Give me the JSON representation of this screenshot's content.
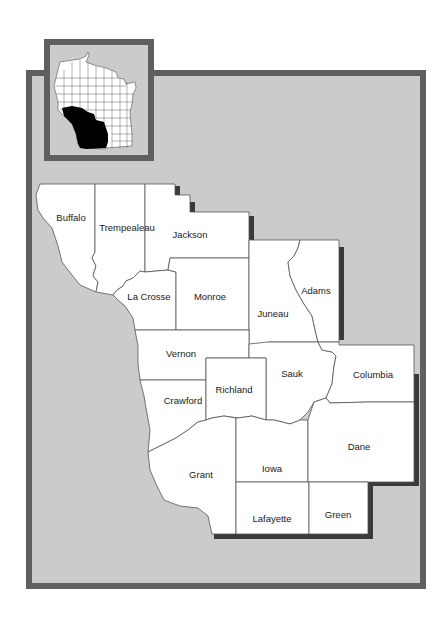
{
  "map": {
    "region": "Southwestern Wisconsin",
    "colors": {
      "frame_border": "#5f5f5f",
      "frame_fill": "#cbcbcb",
      "county_fill": "#ffffff",
      "county_stroke": "#555555",
      "shadow": "#3a3a3a",
      "inset_highlight": "#000000"
    },
    "counties": [
      {
        "name": "Buffalo"
      },
      {
        "name": "Trempealeau"
      },
      {
        "name": "Jackson"
      },
      {
        "name": "La Crosse"
      },
      {
        "name": "Monroe"
      },
      {
        "name": "Juneau"
      },
      {
        "name": "Adams"
      },
      {
        "name": "Vernon"
      },
      {
        "name": "Sauk"
      },
      {
        "name": "Columbia"
      },
      {
        "name": "Crawford"
      },
      {
        "name": "Richland"
      },
      {
        "name": "Grant"
      },
      {
        "name": "Iowa"
      },
      {
        "name": "Dane"
      },
      {
        "name": "Lafayette"
      },
      {
        "name": "Green"
      }
    ],
    "inset": {
      "label": "Wisconsin locator map",
      "highlighted_region": "Southwestern Wisconsin"
    }
  }
}
